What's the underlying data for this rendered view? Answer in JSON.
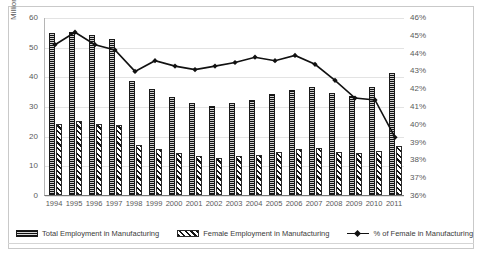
{
  "chart_data": {
    "type": "bar",
    "title": "",
    "xlabel": "",
    "ylabel": "Million",
    "y2label": "",
    "categories": [
      "1994",
      "1995",
      "1996",
      "1997",
      "1998",
      "1999",
      "2000",
      "2001",
      "2002",
      "2003",
      "2004",
      "2005",
      "2006",
      "2007",
      "2008",
      "2009",
      "2010",
      "2011"
    ],
    "ylim": [
      0,
      60
    ],
    "yticks": [
      "0",
      "10",
      "20",
      "30",
      "40",
      "50",
      "60"
    ],
    "y2lim": [
      36,
      46
    ],
    "y2ticks": [
      "36%",
      "37%",
      "38%",
      "39%",
      "40%",
      "41%",
      "42%",
      "43%",
      "44%",
      "45%",
      "46%"
    ],
    "grid": true,
    "legend_position": "bottom",
    "series": [
      {
        "name": "Total Employment in Manufacturing",
        "type": "bar",
        "axis": "left",
        "pattern": "vertical-hatch",
        "values": [
          54.5,
          55.0,
          54.0,
          52.5,
          38.5,
          35.8,
          33.0,
          31.0,
          30.0,
          31.0,
          32.0,
          34.0,
          35.5,
          36.5,
          34.5,
          33.5,
          36.5,
          41.0
        ]
      },
      {
        "name": "Female Employment in Manufacturing",
        "type": "bar",
        "axis": "left",
        "pattern": "diagonal-hatch",
        "values": [
          24.0,
          25.0,
          24.0,
          23.5,
          17.0,
          15.5,
          14.0,
          13.0,
          12.5,
          13.0,
          13.5,
          14.5,
          15.5,
          16.0,
          14.5,
          14.0,
          15.0,
          16.5
        ]
      },
      {
        "name": "% of Female in Manufacturing",
        "type": "line",
        "axis": "right",
        "marker": "diamond",
        "values": [
          44.5,
          45.2,
          44.5,
          44.2,
          43.0,
          43.6,
          43.3,
          43.1,
          43.3,
          43.5,
          43.8,
          43.6,
          43.9,
          43.4,
          42.5,
          41.5,
          41.4,
          39.3
        ]
      }
    ]
  },
  "legend": {
    "items": [
      {
        "label": "Total Employment in Manufacturing",
        "swatch": "vertical-hatch-swatch"
      },
      {
        "label": "Female Employment in Manufacturing",
        "swatch": "diagonal-hatch-swatch"
      },
      {
        "label": "% of Female in Manufacturing",
        "swatch": "line-marker-swatch"
      }
    ]
  },
  "colors": {
    "series_total": "#2b2b2b",
    "series_female": "#141414",
    "series_line": "#111111",
    "grid": "#e3e3e3",
    "axis_text": "#5a5a5a",
    "border": "#c9c9c9"
  }
}
